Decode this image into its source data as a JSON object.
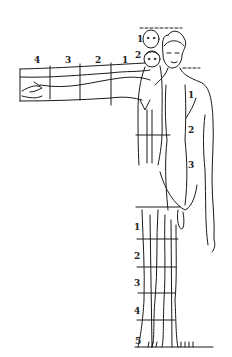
{
  "diagram": {
    "arm_segments": [
      "4",
      "3",
      "2",
      "1"
    ],
    "head_stack": [
      "1",
      "2"
    ],
    "torso_segments": [
      "1",
      "2",
      "3"
    ],
    "leg_segments": [
      "1",
      "2",
      "3",
      "4",
      "5"
    ],
    "line_color": "#1a1a1a",
    "background": "#ffffff"
  }
}
